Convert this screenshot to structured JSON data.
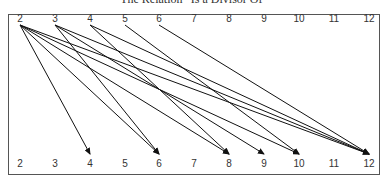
{
  "title": "The Relation “Is a Divisor Of”",
  "diagram": {
    "type": "relation-arrow-diagram",
    "relation": "is a divisor of",
    "top_nodes": [
      "2",
      "3",
      "4",
      "5",
      "6",
      "7",
      "8",
      "9",
      "10",
      "11",
      "12"
    ],
    "bottom_nodes": [
      "2",
      "3",
      "4",
      "5",
      "6",
      "7",
      "8",
      "9",
      "10",
      "11",
      "12"
    ],
    "node_x": [
      20,
      55,
      90,
      125,
      159,
      194,
      229,
      264,
      299,
      334,
      369
    ],
    "edges": [
      {
        "from": "2",
        "to": "4"
      },
      {
        "from": "2",
        "to": "6"
      },
      {
        "from": "2",
        "to": "8"
      },
      {
        "from": "2",
        "to": "10"
      },
      {
        "from": "2",
        "to": "12"
      },
      {
        "from": "3",
        "to": "6"
      },
      {
        "from": "3",
        "to": "9"
      },
      {
        "from": "3",
        "to": "12"
      },
      {
        "from": "4",
        "to": "8"
      },
      {
        "from": "4",
        "to": "12"
      },
      {
        "from": "5",
        "to": "10"
      },
      {
        "from": "6",
        "to": "12"
      }
    ],
    "line_color": "#111111"
  }
}
